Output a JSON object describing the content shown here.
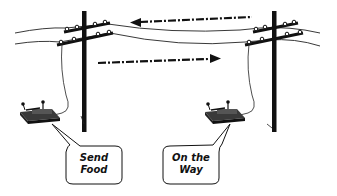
{
  "diagram": {
    "type": "illustration",
    "colors": {
      "ink": "#111111",
      "key_base": "#333333",
      "background": "#ffffff"
    },
    "poles": [
      {
        "id": "left-pole",
        "x": 84
      },
      {
        "id": "right-pole",
        "x": 272
      }
    ],
    "arrows": [
      {
        "id": "arrow-right-to-left",
        "direction": "left",
        "style": "dash-dot"
      },
      {
        "id": "arrow-left-to-right",
        "direction": "right",
        "style": "dash-dot"
      }
    ],
    "stations": [
      {
        "id": "left-station",
        "device": "telegraph-key",
        "message": {
          "line1": "Send",
          "line2": "Food"
        }
      },
      {
        "id": "right-station",
        "device": "telegraph-key",
        "message": {
          "line1": "On the",
          "line2": "Way"
        }
      }
    ]
  }
}
